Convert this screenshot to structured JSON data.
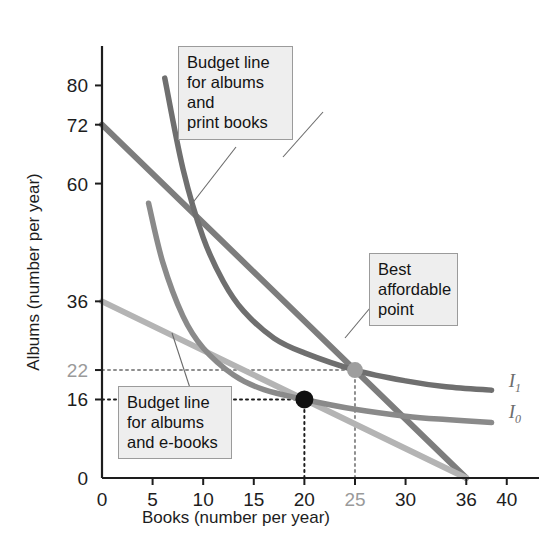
{
  "chart_data": {
    "type": "line",
    "title": "",
    "xlabel": "Books (number per year)",
    "ylabel": "Albums (number per year)",
    "xlim": [
      0,
      42
    ],
    "ylim": [
      0,
      86
    ],
    "grid": false,
    "legend_position": "inline-right",
    "xticks": [
      {
        "value": 0,
        "label": "0",
        "muted": false
      },
      {
        "value": 5,
        "label": "5",
        "muted": false
      },
      {
        "value": 10,
        "label": "10",
        "muted": false
      },
      {
        "value": 15,
        "label": "15",
        "muted": false
      },
      {
        "value": 20,
        "label": "20",
        "muted": false
      },
      {
        "value": 25,
        "label": "25",
        "muted": true
      },
      {
        "value": 30,
        "label": "30",
        "muted": false
      },
      {
        "value": 36,
        "label": "36",
        "muted": false
      },
      {
        "value": 40,
        "label": "40",
        "muted": false
      }
    ],
    "yticks": [
      {
        "value": 80,
        "label": "80",
        "muted": false
      },
      {
        "value": 72,
        "label": "72",
        "muted": false
      },
      {
        "value": 60,
        "label": "60",
        "muted": false
      },
      {
        "value": 36,
        "label": "36",
        "muted": false
      },
      {
        "value": 22,
        "label": "22",
        "muted": true
      },
      {
        "value": 16,
        "label": "16",
        "muted": false
      },
      {
        "value": 0,
        "label": "0",
        "muted": false
      }
    ],
    "series": [
      {
        "name": "Budget line for albums and print books",
        "kind": "budget-line",
        "color": "#7d7d7d",
        "points": [
          [
            0,
            72
          ],
          [
            36,
            0
          ]
        ]
      },
      {
        "name": "Budget line for albums and e-books",
        "kind": "budget-line",
        "color": "#b4b4b4",
        "points": [
          [
            0,
            36
          ],
          [
            36,
            0
          ]
        ]
      },
      {
        "name": "I1",
        "kind": "indifference-curve",
        "color": "#6f6f6f",
        "points": [
          [
            6.2,
            81.5
          ],
          [
            8,
            63
          ],
          [
            10,
            49
          ],
          [
            12,
            40
          ],
          [
            14,
            34
          ],
          [
            17,
            28.5
          ],
          [
            20,
            25.5
          ],
          [
            25,
            22
          ],
          [
            30,
            19.8
          ],
          [
            34,
            18.6
          ],
          [
            38.5,
            17.9
          ]
        ]
      },
      {
        "name": "I0",
        "kind": "indifference-curve",
        "color": "#8a8a8a",
        "points": [
          [
            4.6,
            56
          ],
          [
            6,
            44
          ],
          [
            8,
            33
          ],
          [
            10,
            26.5
          ],
          [
            13,
            21
          ],
          [
            16,
            18
          ],
          [
            20,
            16
          ],
          [
            25,
            14
          ],
          [
            30,
            12.6
          ],
          [
            34,
            11.9
          ],
          [
            38.5,
            11.3
          ]
        ]
      }
    ],
    "points": [
      {
        "name": "best-affordable-point-ebooks",
        "x": 20,
        "y": 16,
        "color": "#111111",
        "radius": 9
      },
      {
        "name": "best-affordable-point-print",
        "x": 25,
        "y": 22,
        "color": "#9e9e9e",
        "radius": 8
      }
    ],
    "guide_lines": [
      {
        "name": "guide-22-horizontal",
        "from": [
          0,
          22
        ],
        "to": [
          25,
          22
        ],
        "style": "dotted",
        "color": "#8e8e8e"
      },
      {
        "name": "guide-25-vertical",
        "from": [
          25,
          0
        ],
        "to": [
          25,
          22
        ],
        "style": "dotted",
        "color": "#8e8e8e"
      },
      {
        "name": "guide-16-horizontal",
        "from": [
          0,
          16
        ],
        "to": [
          20,
          16
        ],
        "style": "dotted",
        "color": "#1d1d1d"
      },
      {
        "name": "guide-20-vertical",
        "from": [
          20,
          0
        ],
        "to": [
          20,
          16
        ],
        "style": "dotted",
        "color": "#1d1d1d"
      }
    ],
    "curve_labels": [
      {
        "name": "I1",
        "base": "I",
        "sub": "1",
        "x": 40.2,
        "y": 18.6
      },
      {
        "name": "I0",
        "base": "I",
        "sub": "0",
        "x": 40.2,
        "y": 12.2
      }
    ]
  },
  "annotations": {
    "budget_print": {
      "name": "callout-budget-print-books",
      "lines": [
        "Budget line",
        "for albums and",
        "print books"
      ]
    },
    "best_point": {
      "name": "callout-best-affordable-point",
      "lines": [
        "Best",
        "affordable",
        "point"
      ]
    },
    "budget_ebooks": {
      "name": "callout-budget-ebooks",
      "lines": [
        "Budget line",
        "for albums",
        "and e-books"
      ]
    }
  },
  "colors": {
    "budget_print": "#7d7d7d",
    "budget_ebooks": "#b4b4b4",
    "curve_i1": "#6f6f6f",
    "curve_i0": "#8a8a8a",
    "callout_bg": "#eeeeee",
    "callout_border": "#9b9b9b",
    "axis": "#1d1d1d",
    "muted_text": "#9a9a9a"
  }
}
